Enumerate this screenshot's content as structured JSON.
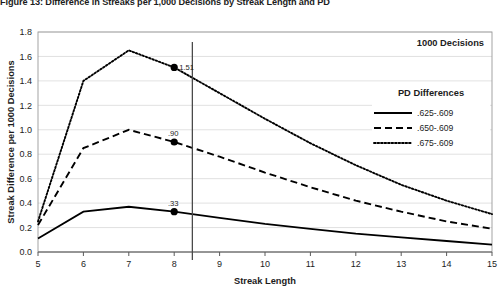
{
  "figure": {
    "title": "Figure 13: Difference in Streaks per 1,000 Decisions by Streak Length and PD",
    "corner_note": "1000 Decisions"
  },
  "legend": {
    "title": "PD Differences",
    "position": "right-inside",
    "entries": [
      {
        "label": ".625-.609",
        "style": "solid"
      },
      {
        "label": ".650-.609",
        "style": "dashed"
      },
      {
        "label": ".675-.609",
        "style": "dotted"
      }
    ]
  },
  "annotations": [
    {
      "label": "1.51",
      "x": 8,
      "y": 1.51,
      "series": ".675-.609"
    },
    {
      "label": ".90",
      "x": 8,
      "y": 0.9,
      "series": ".650-.609"
    },
    {
      "label": ".33",
      "x": 8,
      "y": 0.33,
      "series": ".625-.609"
    }
  ],
  "reference_line": {
    "x": 8.4,
    "orientation": "vertical"
  },
  "axis": {
    "x_ticks": [
      "5",
      "6",
      "7",
      "8",
      "9",
      "10",
      "11",
      "12",
      "13",
      "14",
      "15"
    ],
    "y_ticks": [
      "0.0",
      "0.2",
      "0.4",
      "0.6",
      "0.8",
      "1.0",
      "1.2",
      "1.4",
      "1.6",
      "1.8"
    ]
  },
  "chart_data": {
    "type": "line",
    "title": "Figure 13: Difference in Streaks per 1,000 Decisions by Streak Length and PD",
    "xlabel": "Streak Length",
    "ylabel": "Streak Difference per 1000 Decisions",
    "xlim": [
      5,
      15
    ],
    "ylim": [
      0.0,
      1.8
    ],
    "x": [
      5,
      6,
      7,
      8,
      9,
      10,
      11,
      12,
      13,
      14,
      15
    ],
    "grid": true,
    "legend_position": "right-inside",
    "series": [
      {
        "name": ".625-.609",
        "style": "solid",
        "values": [
          0.11,
          0.33,
          0.37,
          0.33,
          0.28,
          0.23,
          0.19,
          0.15,
          0.12,
          0.09,
          0.06
        ]
      },
      {
        "name": ".650-.609",
        "style": "dashed",
        "values": [
          0.22,
          0.85,
          1.0,
          0.9,
          0.78,
          0.65,
          0.53,
          0.42,
          0.33,
          0.25,
          0.19
        ]
      },
      {
        "name": ".675-.609",
        "style": "dotted",
        "values": [
          0.25,
          1.4,
          1.65,
          1.51,
          1.3,
          1.09,
          0.89,
          0.71,
          0.55,
          0.42,
          0.31
        ]
      }
    ]
  }
}
